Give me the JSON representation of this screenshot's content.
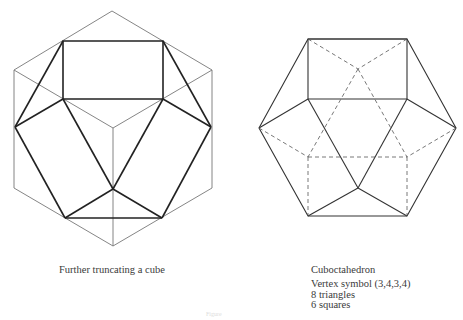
{
  "figures": [
    {
      "caption": "Further truncating a cube",
      "description": "Hexagonal outline of a cube (isometric view) with thin lines; bold cuboctahedron-like edges drawn inside"
    },
    {
      "caption": "Cuboctahedron",
      "details": {
        "vertex_symbol": "Vertex symbol (3,4,3,4)",
        "triangles": "8 triangles",
        "squares": "6 squares"
      },
      "description": "Cuboctahedron with solid visible edges and dashed hidden edges"
    }
  ],
  "footer": {
    "figure_label": "Figure"
  },
  "colors": {
    "thin_line": "#777777",
    "bold_line": "#222222",
    "text": "#3a3a3a"
  }
}
